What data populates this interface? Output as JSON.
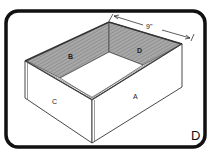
{
  "figure": {
    "corner_label": "D",
    "dimension": {
      "label": "9\""
    },
    "panels": [
      {
        "id": "A",
        "label": "A",
        "role": "front-right outer side"
      },
      {
        "id": "B",
        "label": "B",
        "role": "back-left inner wall"
      },
      {
        "id": "C",
        "label": "C",
        "role": "front-left outer side"
      },
      {
        "id": "D",
        "label": "D",
        "role": "back-right inner wall"
      }
    ]
  },
  "colors": {
    "frame": "#111111",
    "line": "#333333",
    "inner_wall": "#9a9a9a",
    "background": "#ffffff"
  }
}
